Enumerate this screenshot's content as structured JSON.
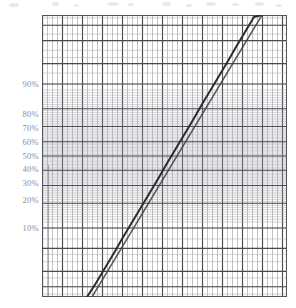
{
  "figure": {
    "background_color": "#ffffff",
    "kind": "normal-probability-plot"
  },
  "plot_area": {
    "left": 42,
    "top": 15,
    "width": 245,
    "height": 282,
    "border_color": "#555559"
  },
  "axes": {
    "y": {
      "label_color": "#8e8e93",
      "ticks": [
        {
          "label": "90%",
          "value": 90,
          "y": 84
        },
        {
          "label": "80%",
          "value": 80,
          "y": 114
        },
        {
          "label": "70%",
          "value": 70,
          "y": 128
        },
        {
          "label": "60%",
          "value": 60,
          "y": 142
        },
        {
          "label": "50%",
          "value": 50,
          "y": 156
        },
        {
          "label": "40%",
          "value": 40,
          "y": 169
        },
        {
          "label": "30%",
          "value": 30,
          "y": 183
        },
        {
          "label": "20%",
          "value": 20,
          "y": 200
        },
        {
          "label": "10%",
          "value": 10,
          "y": 228
        }
      ]
    }
  },
  "grid": {
    "minor_color": "#9a9aa0",
    "major_color": "#4a4a4f",
    "vertical_spacing": 5,
    "vertical_major_every": 4,
    "horizontal_minor_color": "#a6a6ac",
    "horizontal_major_color": "#4a4a4f"
  },
  "series_style": {
    "data_color": "#2b2b2e",
    "reference_color": "#3d3d41"
  },
  "chart_data": {
    "type": "line",
    "title": "",
    "subtitle": "",
    "xlabel": "",
    "ylabel": "",
    "grid": true,
    "legend": "none",
    "y_scale": "normal-probability (probit)",
    "x_scale": "linear",
    "ytick_labels": [
      "10%",
      "20%",
      "30%",
      "40%",
      "50%",
      "60%",
      "70%",
      "80%",
      "90%"
    ],
    "ytick_values": [
      10,
      20,
      30,
      40,
      50,
      60,
      70,
      80,
      90
    ],
    "ylim": [
      0.2,
      99.8
    ],
    "xlim": [
      0,
      49
    ],
    "series": [
      {
        "name": "data",
        "kind": "empirical",
        "points_px": [
          [
            87,
            297
          ],
          [
            96,
            283
          ],
          [
            105,
            268
          ],
          [
            114,
            253
          ],
          [
            122,
            239
          ],
          [
            131,
            224
          ],
          [
            140,
            209
          ],
          [
            149,
            194
          ],
          [
            158,
            179
          ],
          [
            166,
            165
          ],
          [
            175,
            150
          ],
          [
            184,
            135
          ],
          [
            193,
            120
          ],
          [
            201,
            106
          ],
          [
            210,
            91
          ],
          [
            219,
            76
          ],
          [
            228,
            61
          ],
          [
            236,
            47
          ],
          [
            245,
            32
          ],
          [
            254,
            17
          ],
          [
            262,
            15
          ]
        ],
        "percent_values": [
          0.4,
          1.0,
          2.0,
          3.5,
          6.0,
          9.5,
          15,
          21,
          29,
          37,
          46,
          55,
          64,
          72,
          79,
          86,
          91,
          94.5,
          97,
          99,
          99.4
        ]
      },
      {
        "name": "reference-fit",
        "kind": "straight-line-fit",
        "points_px": [
          [
            92,
            297
          ],
          [
            262,
            15
          ]
        ]
      }
    ]
  }
}
